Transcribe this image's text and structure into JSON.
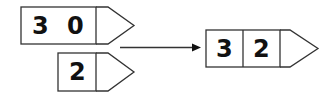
{
  "diagram": {
    "type": "place-value addition",
    "boxes": [
      {
        "id": "tens",
        "digits": [
          "3",
          "0"
        ]
      },
      {
        "id": "ones",
        "digits": [
          "2"
        ]
      },
      {
        "id": "result",
        "digits": [
          "3",
          "2"
        ]
      }
    ],
    "arrow": {
      "from": "inputs",
      "to": "result"
    }
  }
}
